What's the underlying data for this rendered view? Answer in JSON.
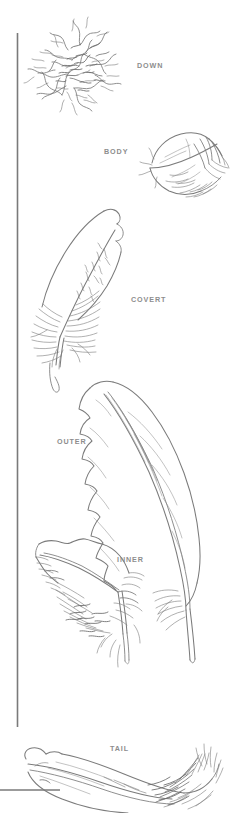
{
  "figure": {
    "width": 250,
    "height": 813,
    "background_color": "#ffffff",
    "ink_color": "#7b7b7b",
    "label_color": "#8d8d8d",
    "rule_color": "#7a7a7a"
  },
  "rules": {
    "vertical": {
      "x": 17,
      "y_top": 33,
      "y_bottom": 727
    },
    "horizontal": {
      "y": 790,
      "x_left": 0,
      "x_right": 60
    }
  },
  "labels": [
    {
      "key": "down",
      "text": "DOWN",
      "x": 137,
      "y": 62
    },
    {
      "key": "body",
      "text": "BODY",
      "x": 104,
      "y": 148
    },
    {
      "key": "covert",
      "text": "COVERT",
      "x": 131,
      "y": 296
    },
    {
      "key": "outer",
      "text": "OUTER",
      "x": 57,
      "y": 438
    },
    {
      "key": "inner",
      "text": "INNER",
      "x": 117,
      "y": 556
    },
    {
      "key": "tail",
      "text": "TAIL",
      "x": 110,
      "y": 745
    }
  ],
  "specimens": [
    {
      "key": "down",
      "label": "DOWN",
      "description": "Tangled, fluffy plumule cluster of loose barbs with no firm vane"
    },
    {
      "key": "body",
      "label": "BODY",
      "description": "Small contour feather with rounded vane and downy base"
    },
    {
      "key": "covert",
      "label": "COVERT",
      "description": "Medium covert feather with broad asymmetric vane and downy afterfeather"
    },
    {
      "key": "outer",
      "label": "OUTER",
      "description": "Long outer primary flight feather, narrow leading vane, curved shaft"
    },
    {
      "key": "inner",
      "label": "INNER",
      "description": "Inner secondary flight feather, broad vane, heavy downy base"
    },
    {
      "key": "tail",
      "label": "TAIL",
      "description": "Long curved tail rectrix with ragged barbs at the tip"
    }
  ]
}
